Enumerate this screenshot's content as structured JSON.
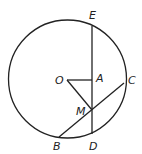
{
  "diagram": {
    "circle": {
      "cx": 67.5,
      "cy": 79,
      "r": 59
    },
    "points": {
      "O": {
        "x": 67,
        "y": 80,
        "label": "O",
        "lx": 55,
        "ly": 84
      },
      "A": {
        "x": 92,
        "y": 80,
        "label": "A",
        "lx": 96,
        "ly": 82
      },
      "E": {
        "x": 92,
        "y": 26,
        "label": "E",
        "lx": 89,
        "ly": 19
      },
      "D": {
        "x": 92,
        "y": 134,
        "label": "D",
        "lx": 89,
        "ly": 150
      },
      "M": {
        "x": 92,
        "y": 110,
        "label": "M",
        "lx": 76,
        "ly": 115
      },
      "B": {
        "x": 59,
        "y": 137,
        "label": "B",
        "lx": 53,
        "ly": 150
      },
      "C": {
        "x": 124,
        "y": 83,
        "label": "C",
        "lx": 128,
        "ly": 84
      }
    },
    "segments": [
      [
        "E",
        "D"
      ],
      [
        "O",
        "A"
      ],
      [
        "O",
        "M"
      ],
      [
        "B",
        "C"
      ]
    ],
    "stroke_color": "#222222",
    "background": "#ffffff"
  }
}
